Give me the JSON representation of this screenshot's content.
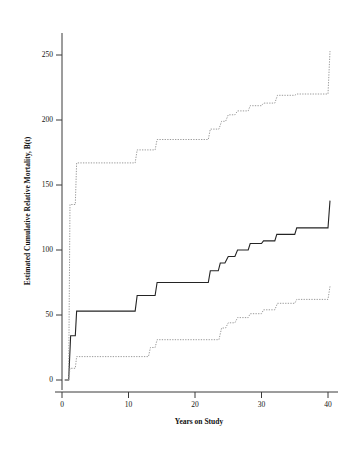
{
  "chart_data": {
    "type": "line",
    "title": "",
    "xlabel": "Years on Study",
    "ylabel": "Estimated Cumulative Relative Mortality, B(t)",
    "xlim": [
      -1.5,
      41
    ],
    "ylim": [
      -8,
      268
    ],
    "xticks": [
      0,
      10,
      20,
      30,
      40
    ],
    "xtick_labels": [
      "0",
      "10",
      "20",
      "30",
      "40"
    ],
    "yticks": [
      0,
      50,
      100,
      150,
      200,
      250
    ],
    "ytick_labels": [
      "0",
      "50",
      "100",
      "150",
      "200",
      "250"
    ],
    "grid": false,
    "legend": null,
    "step_type": "post",
    "series": [
      {
        "name": "Estimate",
        "style": "solid",
        "color": "#242424",
        "x": [
          0.4,
          1.0,
          1.3,
          2.0,
          2.2,
          11.0,
          11.3,
          14.0,
          14.3,
          22.0,
          22.3,
          23.5,
          23.8,
          24.5,
          25.0,
          26.0,
          26.4,
          28.0,
          28.3,
          30.0,
          30.3,
          32.0,
          32.3,
          35.0,
          35.3,
          40.0,
          40.3
        ],
        "y": [
          0,
          0,
          34,
          34,
          53,
          53,
          65,
          65,
          75,
          75,
          84,
          84,
          90,
          90,
          95,
          95,
          100,
          100,
          105,
          105,
          107,
          107,
          112,
          112,
          117,
          117,
          138
        ]
      },
      {
        "name": "Upper 95% confidence limit",
        "style": "dotted",
        "color": "#8f8f8f",
        "x": [
          1.0,
          1.2,
          1.6,
          2.0,
          2.2,
          11.0,
          11.3,
          14.0,
          14.3,
          22.0,
          22.3,
          23.6,
          24.0,
          24.6,
          25.0,
          26.0,
          26.4,
          28.0,
          28.3,
          30.0,
          30.3,
          32.0,
          32.4,
          35.0,
          35.3,
          40.0,
          40.3
        ],
        "y": [
          0,
          135,
          135,
          135,
          167,
          167,
          177,
          177,
          185,
          185,
          193,
          193,
          199,
          199,
          204,
          204,
          207,
          207,
          211,
          211,
          213,
          213,
          219,
          219,
          220,
          220,
          253
        ]
      },
      {
        "name": "Lower 95% confidence limit",
        "style": "dotted",
        "color": "#8f8f8f",
        "x": [
          1.0,
          1.2,
          1.6,
          2.0,
          2.2,
          11.0,
          11.3,
          13.0,
          13.3,
          14.0,
          14.3,
          22.0,
          22.3,
          23.6,
          24.0,
          24.6,
          25.0,
          26.0,
          26.4,
          28.0,
          28.3,
          30.0,
          30.3,
          32.0,
          32.4,
          35.0,
          35.3,
          40.0,
          40.3
        ],
        "y": [
          0,
          9,
          9,
          9,
          18,
          18,
          18,
          18,
          25,
          25,
          31,
          31,
          31,
          31,
          40,
          40,
          44,
          44,
          48,
          48,
          51,
          51,
          54,
          54,
          59,
          59,
          62,
          62,
          72
        ]
      }
    ]
  }
}
